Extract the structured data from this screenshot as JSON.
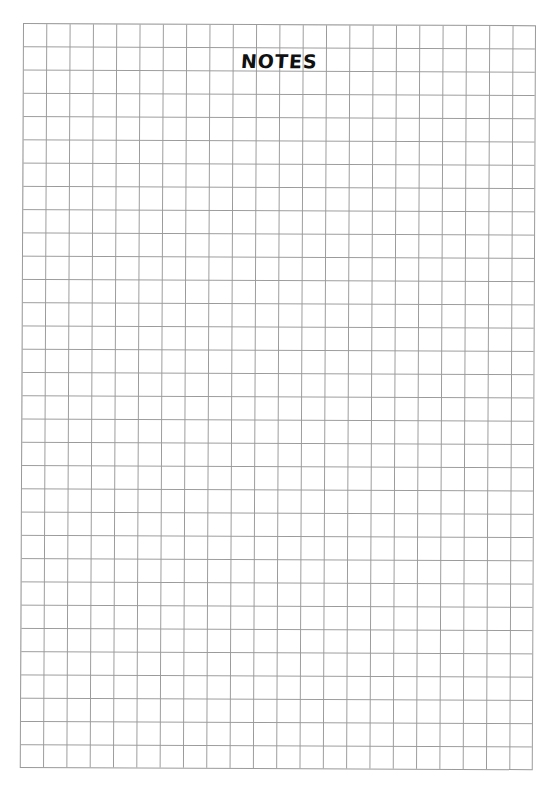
{
  "page": {
    "title": "NOTES",
    "grid": {
      "columns": 22,
      "rows": 32,
      "line_color": "#9a9a9a",
      "background_color": "#ffffff"
    },
    "text_color": "#111111"
  }
}
